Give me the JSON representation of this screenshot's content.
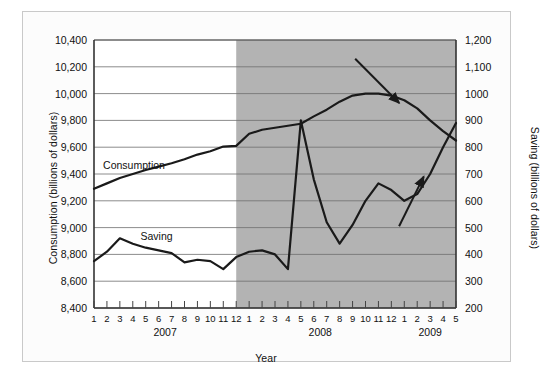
{
  "chart_data": {
    "type": "line",
    "title": "",
    "xlabel": "Year",
    "ylabel": "Consumption (billions of dollars)",
    "ylabel_right": "Saving (billions of dollars)",
    "x_tick_labels": [
      "1",
      "2",
      "3",
      "4",
      "5",
      "6",
      "7",
      "8",
      "9",
      "10",
      "11",
      "12",
      "1",
      "2",
      "3",
      "4",
      "5",
      "6",
      "7",
      "8",
      "9",
      "10",
      "11",
      "12",
      "1",
      "2",
      "3",
      "4",
      "5"
    ],
    "x_group_labels": [
      "2007",
      "2008",
      "2009"
    ],
    "ylim": [
      8400,
      10400
    ],
    "y_tick_labels": [
      "8,400",
      "8,600",
      "8,800",
      "9,000",
      "9,200",
      "9,400",
      "9,600",
      "9,800",
      "10,000",
      "10,200",
      "10,400"
    ],
    "y_tick_values": [
      8400,
      8600,
      8800,
      9000,
      9200,
      9400,
      9600,
      9800,
      10000,
      10200,
      10400
    ],
    "ylim_right": [
      200,
      1200
    ],
    "y_tick_labels_right": [
      "200",
      "300",
      "400",
      "500",
      "600",
      "700",
      "800",
      "900",
      "1000",
      "1,100",
      "1,200"
    ],
    "y_tick_values_right": [
      200,
      300,
      400,
      500,
      600,
      700,
      800,
      900,
      1000,
      1100,
      1200
    ],
    "grid": true,
    "legend_position": "inline-labels",
    "shaded_region": {
      "label": "recession",
      "start_index": 11,
      "end_index": 28,
      "color": "#b3b3b3"
    },
    "series": [
      {
        "name": "Consumption",
        "axis": "left",
        "color": "#1a1a1a",
        "inline_label": "Consumption",
        "values": [
          9290,
          9330,
          9370,
          9400,
          9430,
          9455,
          9480,
          9510,
          9545,
          9570,
          9605,
          9610,
          9700,
          9730,
          9745,
          9760,
          9775,
          9830,
          9880,
          9940,
          9985,
          10000,
          10000,
          9985,
          9950,
          9890,
          9800,
          9720,
          9650
        ]
      },
      {
        "name": "Saving",
        "axis": "right",
        "color": "#1a1a1a",
        "inline_label": "Saving",
        "values": [
          375,
          410,
          460,
          440,
          425,
          415,
          405,
          370,
          380,
          375,
          345,
          390,
          410,
          415,
          400,
          345,
          900,
          680,
          520,
          440,
          510,
          600,
          665,
          640,
          600,
          625,
          700,
          800,
          890
        ]
      }
    ],
    "annotations": [
      {
        "name": "consumption-down-arrow",
        "direction": "down-right"
      },
      {
        "name": "saving-up-arrow",
        "direction": "up-right"
      }
    ]
  }
}
